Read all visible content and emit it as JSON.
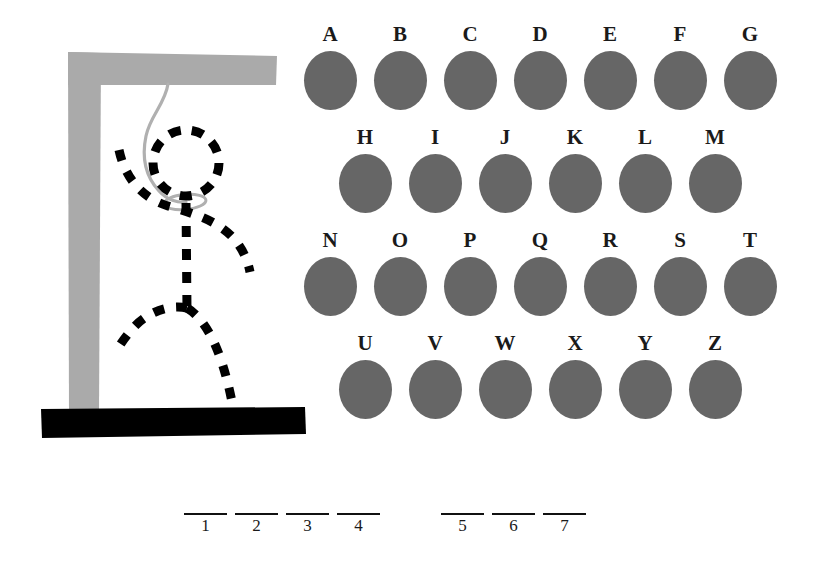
{
  "game": {
    "title": "Hangman",
    "colors": {
      "background": "#ffffff",
      "gallows_post": "#aaaaaa",
      "gallows_base": "#000000",
      "rope": "#b0b0b0",
      "figure": "#000000",
      "letter_disc": "#666666",
      "text": "#1a1a1a"
    }
  },
  "gallows": {
    "name": "hangman-gallows",
    "post_color": "#aaaaaa",
    "beam_color": "#aaaaaa",
    "base_color": "#000000",
    "rope_color": "#b0b0b0",
    "figure_color": "#000000",
    "figure_style": "dashed",
    "parts_drawn": [
      "post",
      "crossbeam",
      "base",
      "rope",
      "noose",
      "head",
      "arms",
      "body",
      "legs"
    ],
    "wrong_guesses": 6
  },
  "letter_grid": {
    "name": "letter-bank",
    "rows": [
      {
        "offset": 0,
        "letters": [
          {
            "letter": "A",
            "state": "available"
          },
          {
            "letter": "B",
            "state": "available"
          },
          {
            "letter": "C",
            "state": "available"
          },
          {
            "letter": "D",
            "state": "available"
          },
          {
            "letter": "E",
            "state": "available"
          },
          {
            "letter": "F",
            "state": "available"
          },
          {
            "letter": "G",
            "state": "available"
          }
        ]
      },
      {
        "offset": 35,
        "letters": [
          {
            "letter": "H",
            "state": "available"
          },
          {
            "letter": "I",
            "state": "available"
          },
          {
            "letter": "J",
            "state": "available"
          },
          {
            "letter": "K",
            "state": "available"
          },
          {
            "letter": "L",
            "state": "available"
          },
          {
            "letter": "M",
            "state": "available"
          }
        ]
      },
      {
        "offset": 0,
        "letters": [
          {
            "letter": "N",
            "state": "available"
          },
          {
            "letter": "O",
            "state": "available"
          },
          {
            "letter": "P",
            "state": "available"
          },
          {
            "letter": "Q",
            "state": "available"
          },
          {
            "letter": "R",
            "state": "available"
          },
          {
            "letter": "S",
            "state": "available"
          },
          {
            "letter": "T",
            "state": "available"
          }
        ]
      },
      {
        "offset": 35,
        "letters": [
          {
            "letter": "U",
            "state": "available"
          },
          {
            "letter": "V",
            "state": "available"
          },
          {
            "letter": "W",
            "state": "available"
          },
          {
            "letter": "X",
            "state": "available"
          },
          {
            "letter": "Y",
            "state": "available"
          },
          {
            "letter": "Z",
            "state": "available"
          }
        ]
      }
    ]
  },
  "word_blanks": {
    "name": "word-blanks",
    "total_slots": 7,
    "groups": [
      {
        "slots": [
          {
            "number": "1",
            "letter": ""
          },
          {
            "number": "2",
            "letter": ""
          },
          {
            "number": "3",
            "letter": ""
          },
          {
            "number": "4",
            "letter": ""
          }
        ]
      },
      {
        "slots": [
          {
            "number": "5",
            "letter": ""
          },
          {
            "number": "6",
            "letter": ""
          },
          {
            "number": "7",
            "letter": ""
          }
        ]
      }
    ]
  }
}
